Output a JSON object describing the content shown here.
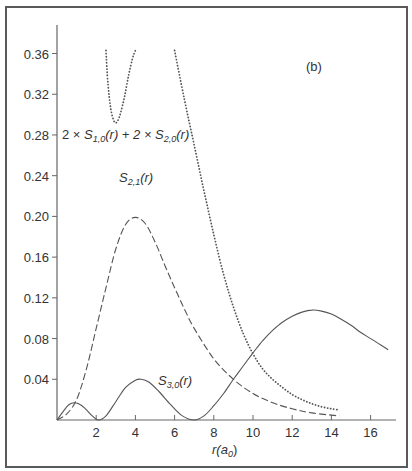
{
  "chart_data": {
    "type": "line",
    "title": "",
    "panel_label": "(b)",
    "xlabel": "r(a0)",
    "xlabel_parts": {
      "base": "r(a",
      "sub": "0",
      "close": ")"
    },
    "ylabel": "",
    "xlim": [
      0,
      17.3
    ],
    "ylim": [
      0,
      0.38
    ],
    "x_ticks": [
      2,
      4,
      6,
      8,
      10,
      12,
      14,
      16
    ],
    "y_ticks": [
      0.04,
      0.08,
      0.12,
      0.16,
      0.2,
      0.24,
      0.28,
      0.32,
      0.36
    ],
    "y_tick_labels": [
      "0.04",
      "0.08",
      "0.12",
      "0.16",
      "0.20",
      "0.24",
      "0.28",
      "0.32",
      "0.36"
    ],
    "grid": false,
    "legend": "inline annotations",
    "series": [
      {
        "name": "2 × S1,0(r) + 2 × S2,0(r)",
        "style": "dotted",
        "segments": [
          {
            "x": [
              2.5,
              2.6,
              2.75,
              2.9,
              3.0,
              3.1,
              3.25,
              3.45,
              3.65,
              3.85,
              4.0
            ],
            "y": [
              0.363,
              0.33,
              0.305,
              0.294,
              0.292,
              0.294,
              0.302,
              0.318,
              0.338,
              0.355,
              0.363
            ]
          },
          {
            "x": [
              6.0,
              6.5,
              7.0,
              7.5,
              8.0,
              8.5,
              9.0,
              9.5,
              10.0,
              10.5,
              11.0,
              11.5,
              12.0,
              12.5,
              13.0,
              13.5,
              14.0,
              14.4
            ],
            "y": [
              0.363,
              0.315,
              0.27,
              0.225,
              0.182,
              0.143,
              0.111,
              0.085,
              0.065,
              0.05,
              0.04,
              0.032,
              0.025,
              0.02,
              0.016,
              0.013,
              0.011,
              0.01
            ]
          }
        ]
      },
      {
        "name": "S2,1(r)",
        "style": "dashed",
        "x": [
          0,
          0.5,
          1.0,
          1.5,
          2.0,
          2.5,
          3.0,
          3.5,
          4.0,
          4.5,
          5.0,
          5.5,
          6.0,
          6.5,
          7.0,
          8.0,
          9.0,
          10.0,
          11.0,
          12.0,
          13.0,
          14.4
        ],
        "y": [
          0,
          0.006,
          0.02,
          0.05,
          0.09,
          0.13,
          0.168,
          0.192,
          0.199,
          0.193,
          0.175,
          0.152,
          0.13,
          0.109,
          0.09,
          0.06,
          0.04,
          0.026,
          0.017,
          0.011,
          0.007,
          0.004
        ]
      },
      {
        "name": "S3,0(r)",
        "style": "solid",
        "x": [
          0,
          0.3,
          0.6,
          0.9,
          1.2,
          1.5,
          1.8,
          2.1,
          2.5,
          3.0,
          3.5,
          4.0,
          4.3,
          4.7,
          5.2,
          5.8,
          6.4,
          7.0,
          7.5,
          8.0,
          8.5,
          9.0,
          9.5,
          10.0,
          10.5,
          11.0,
          11.5,
          12.0,
          12.5,
          13.0,
          13.5,
          14.0,
          14.5,
          15.0,
          15.5,
          16.0,
          16.5,
          16.9
        ],
        "y": [
          0,
          0.008,
          0.015,
          0.017,
          0.015,
          0.01,
          0.004,
          0.0,
          0.004,
          0.018,
          0.032,
          0.039,
          0.04,
          0.037,
          0.028,
          0.015,
          0.004,
          0.0,
          0.004,
          0.014,
          0.026,
          0.04,
          0.053,
          0.066,
          0.078,
          0.088,
          0.096,
          0.102,
          0.106,
          0.108,
          0.107,
          0.104,
          0.099,
          0.093,
          0.086,
          0.08,
          0.074,
          0.069
        ]
      }
    ],
    "annotations": [
      {
        "text_parts": [
          "2 × ",
          "S",
          "1,0",
          "(r) + 2 × ",
          "S",
          "2,0",
          "(r)"
        ],
        "target": "2 × S1,0(r) + 2 × S2,0(r)"
      },
      {
        "text_parts": [
          "S",
          "2,1",
          "(r)"
        ],
        "target": "S2,1(r)"
      },
      {
        "text_parts": [
          "S",
          "3,0",
          "(r)"
        ],
        "target": "S3,0(r)"
      }
    ]
  },
  "labels": {
    "panel": "(b)",
    "ann1_a": "2 × ",
    "ann1_s": "S",
    "ann1_sub1": "1,0",
    "ann1_mid": "(r) + 2 × ",
    "ann1_s2": "S",
    "ann1_sub2": "2,0",
    "ann1_end": "(r)",
    "ann2_s": "S",
    "ann2_sub": "2,1",
    "ann2_end": "(r)",
    "ann3_s": "S",
    "ann3_sub": "3,0",
    "ann3_end": "(r)",
    "xlabel_base": "r(a",
    "xlabel_sub": "0",
    "xlabel_close": ")"
  },
  "colors": {
    "line": "#555555",
    "axis": "#666666",
    "frame": "#5a5a5a",
    "text": "#333333"
  }
}
